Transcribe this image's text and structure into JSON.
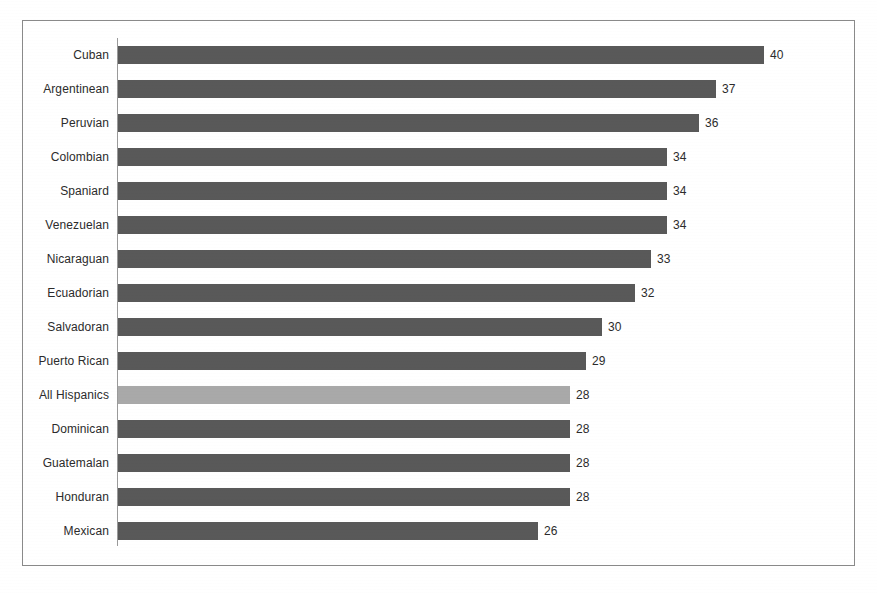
{
  "chart_data": {
    "type": "bar",
    "orientation": "horizontal",
    "title": "",
    "subtitle": "",
    "xlabel": "",
    "ylabel": "",
    "xlim": [
      0,
      42
    ],
    "grid": false,
    "legend": false,
    "categories": [
      "Cuban",
      "Argentinean",
      "Peruvian",
      "Colombian",
      "Spaniard",
      "Venezuelan",
      "Nicaraguan",
      "Ecuadorian",
      "Salvadoran",
      "Puerto Rican",
      "All Hispanics",
      "Dominican",
      "Guatemalan",
      "Honduran",
      "Mexican"
    ],
    "values": [
      40,
      37,
      36,
      34,
      34,
      34,
      33,
      32,
      30,
      29,
      28,
      28,
      28,
      28,
      26
    ],
    "value_labels": [
      "40",
      "37",
      "36",
      "34",
      "34",
      "34",
      "33",
      "32",
      "30",
      "29",
      "28",
      "28",
      "28",
      "28",
      "26"
    ],
    "highlighted_category": "All Hispanics",
    "colors": {
      "bar": "#595959",
      "bar_highlight": "#a9a9a9",
      "axis_line": "#9a9a9a",
      "frame_border": "#8a8a8a",
      "text": "#2b2b2b",
      "background": "#ffffff"
    }
  }
}
